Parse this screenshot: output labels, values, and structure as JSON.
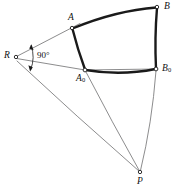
{
  "figure": {
    "type": "geometry-diagram",
    "width": 179,
    "height": 189,
    "background_color": "#ffffff",
    "thick_curve_color": "#1a1a1a",
    "thin_line_color": "#6e6e70",
    "label_color": "#111111"
  },
  "labels": {
    "R": "R",
    "A": "A",
    "B": "B",
    "A0_letter": "A",
    "A0_sub": "0",
    "B0_letter": "B",
    "B0_sub": "0",
    "P": "P",
    "angle": "90°"
  },
  "points": [
    {
      "name": "R",
      "label": "R",
      "x": 16,
      "y": 57
    },
    {
      "name": "A",
      "label": "A",
      "x": 72,
      "y": 28
    },
    {
      "name": "B",
      "label": "B",
      "x": 157,
      "y": 7
    },
    {
      "name": "A0",
      "label": "A0",
      "x": 85,
      "y": 70
    },
    {
      "name": "B0",
      "label": "B0",
      "x": 156,
      "y": 69
    },
    {
      "name": "P",
      "label": "P",
      "x": 140,
      "y": 172
    }
  ],
  "thick_edges": [
    {
      "name": "arc-A-B",
      "from": "A",
      "to": "B",
      "style": "arc-convex-up"
    },
    {
      "name": "edge-B-B0",
      "from": "B",
      "to": "B0",
      "style": "slight-bow-left"
    },
    {
      "name": "arc-A0-B0",
      "from": "A0",
      "to": "B0",
      "style": "arc-concave-up"
    },
    {
      "name": "edge-A-A0",
      "from": "A",
      "to": "A0",
      "style": "slight-bow-right"
    }
  ],
  "thin_edges": [
    {
      "name": "ray-R-A",
      "from": "R",
      "to": "A"
    },
    {
      "name": "ray-R-B0",
      "from": "R",
      "to": "B0"
    },
    {
      "name": "ray-R-P",
      "from": "R",
      "to": "P"
    },
    {
      "name": "seg-A0-P",
      "from": "A0",
      "to": "P"
    },
    {
      "name": "seg-B0-P",
      "from": "B0",
      "to": "P"
    }
  ],
  "annotations": [
    {
      "name": "right-angle-marker",
      "label": "90°",
      "at_vertex": "R",
      "label_x": 37,
      "label_y": 51
    }
  ]
}
